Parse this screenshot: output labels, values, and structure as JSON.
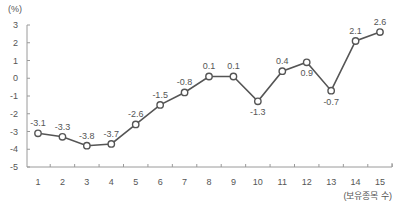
{
  "chart_data": {
    "type": "line",
    "title": "",
    "unit_label": "(%)",
    "xlabel": "(보유종목 수)",
    "ylabel": "(%)",
    "categories": [
      "1",
      "2",
      "3",
      "4",
      "5",
      "6",
      "7",
      "8",
      "9",
      "10",
      "11",
      "12",
      "13",
      "14",
      "15"
    ],
    "series": [
      {
        "name": "returns",
        "values": [
          -3.1,
          -3.3,
          -3.8,
          -3.7,
          -2.6,
          -1.5,
          -0.8,
          0.1,
          0.1,
          -1.3,
          0.4,
          0.9,
          -0.7,
          2.1,
          2.6
        ],
        "labels": [
          "-3.1",
          "-3.3",
          "-3.8",
          "-3.7",
          "-2.6",
          "-1.5",
          "-0.8",
          "0.1",
          "0.1",
          "-1.3",
          "0.4",
          "0.9",
          "-0.7",
          "2.1",
          "2.6"
        ],
        "label_positions": [
          "above",
          "above",
          "above",
          "above",
          "above",
          "above",
          "above",
          "above",
          "above",
          "below",
          "above",
          "below",
          "below",
          "above",
          "above"
        ]
      }
    ],
    "ylim": [
      -5,
      3
    ],
    "yticks": [
      "3",
      "2",
      "1",
      "0",
      "-1",
      "-2",
      "-3",
      "-4",
      "-5"
    ],
    "grid": false,
    "legend": "none",
    "colors": {
      "line": "#555555",
      "axis": "#9a9a9a",
      "text": "#555555",
      "marker_fill": "#ffffff"
    }
  }
}
